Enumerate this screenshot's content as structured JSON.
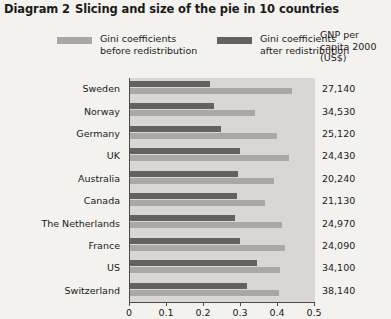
{
  "title": {
    "number": "Diagram 2",
    "text": "Slicing and size of the pie in 10 countries"
  },
  "legend": {
    "before": {
      "line1": "Gini coefficients",
      "line2": "before redistribution",
      "color": "#a9a8a4"
    },
    "after": {
      "line1": "Gini coefficients",
      "line2": "after redistribution",
      "color": "#63625f"
    }
  },
  "gnp_header": {
    "line1": "GNP per",
    "line2": "capita 2000",
    "line3": "(US$)"
  },
  "axis": {
    "ticks": [
      "0",
      "0.1",
      "0.2",
      "0.3",
      "0.4",
      "0.5"
    ]
  },
  "chart_data": {
    "type": "bar",
    "orientation": "horizontal",
    "xlabel": "",
    "ylabel": "",
    "xlim": [
      0,
      0.5
    ],
    "grid": false,
    "legend_position": "top",
    "categories": [
      "Sweden",
      "Norway",
      "Germany",
      "UK",
      "Australia",
      "Canada",
      "The Netherlands",
      "France",
      "US",
      "Switzerland"
    ],
    "series": [
      {
        "name": "Gini coefficients after redistribution",
        "color": "#63625f",
        "values": [
          0.215,
          0.228,
          0.247,
          0.296,
          0.293,
          0.288,
          0.283,
          0.296,
          0.342,
          0.315
        ]
      },
      {
        "name": "Gini coefficients before redistribution",
        "color": "#a9a8a4",
        "values": [
          0.437,
          0.337,
          0.397,
          0.429,
          0.389,
          0.364,
          0.41,
          0.419,
          0.405,
          0.402
        ]
      }
    ],
    "annotations": {
      "column_header": "GNP per capita 2000 (US$)",
      "column_values": [
        "27,140",
        "34,530",
        "25,120",
        "24,430",
        "20,240",
        "21,130",
        "24,970",
        "24,090",
        "34,100",
        "38,140"
      ]
    }
  }
}
